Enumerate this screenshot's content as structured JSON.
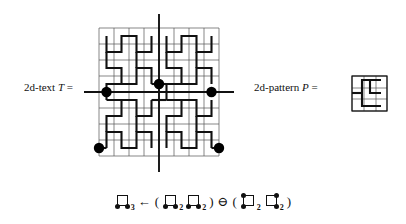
{
  "figure": {
    "left_label": {
      "text": "2d-text T =",
      "prefix": "2d-text",
      "symbol": "T",
      "equals": "="
    },
    "right_label": {
      "text": "2d-pattern P =",
      "prefix": "2d-pattern",
      "symbol": "P",
      "equals": "="
    },
    "grid": {
      "columns": 8,
      "rows": 8,
      "thin_line_color": "#555555",
      "curve_color": "#111111",
      "axis_color": "#111111",
      "marker_color": "#000000",
      "marker_count": 5,
      "markers": [
        {
          "name": "match-center",
          "col": 4,
          "row": 3
        },
        {
          "name": "match-left",
          "col": 1,
          "row": 4
        },
        {
          "name": "match-right",
          "col": 7,
          "row": 4
        },
        {
          "name": "match-bottom-left",
          "col": 0,
          "row": 7
        },
        {
          "name": "match-bottom-right",
          "col": 7,
          "row": 7
        }
      ]
    },
    "pattern_box": {
      "columns": 3,
      "rows": 3,
      "border_color": "#111111"
    }
  },
  "formula": {
    "text": "□₃ ← ( □₂  □₂ ) ⊖ ( □₂  □₂ )",
    "tokens": [
      {
        "kind": "glyph",
        "name": "glyph-square-bl-br",
        "dots": [
          "bl",
          "br"
        ],
        "subscript": "3"
      },
      {
        "kind": "op",
        "name": "assign-arrow",
        "text": "←"
      },
      {
        "kind": "op",
        "name": "open-paren-1",
        "text": "("
      },
      {
        "kind": "glyph",
        "name": "glyph-square-bl-br-a",
        "dots": [
          "bl",
          "br"
        ],
        "subscript": "2"
      },
      {
        "kind": "glyph",
        "name": "glyph-square-bl-br-b",
        "dots": [
          "bl",
          "br"
        ],
        "subscript": "2"
      },
      {
        "kind": "op",
        "name": "close-paren-1",
        "text": ")"
      },
      {
        "kind": "op",
        "name": "circled-minus",
        "text": "⊖"
      },
      {
        "kind": "op",
        "name": "open-paren-2",
        "text": "("
      },
      {
        "kind": "glyph",
        "name": "glyph-square-tl-bl",
        "dots": [
          "tl",
          "bl"
        ],
        "subscript": "2"
      },
      {
        "kind": "glyph",
        "name": "glyph-square-tr-br",
        "dots": [
          "tr",
          "br"
        ],
        "subscript": "2"
      },
      {
        "kind": "op",
        "name": "close-paren-2",
        "text": ")"
      }
    ]
  }
}
